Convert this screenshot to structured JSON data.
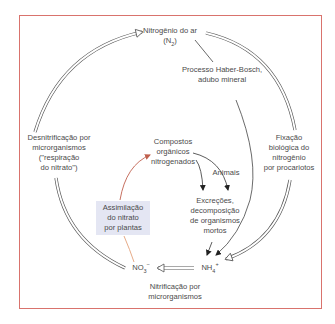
{
  "diagram": {
    "nodes": {
      "n2": {
        "line1": "Nitrogênio do ar",
        "formula_prefix": "(N",
        "formula_sub": "2",
        "formula_suffix": ")"
      },
      "haber": {
        "line1": "Processo Haber-Bosch,",
        "line2": "adubo mineral"
      },
      "denitrification": {
        "line1": "Desnitrificação por",
        "line2": "microrganismos",
        "line3": "(\"respiração",
        "line4": "do nitrato\")"
      },
      "fixation": {
        "line1": "Fixação",
        "line2": "biológica do",
        "line3": "nitrogênio",
        "line4": "por procariotos"
      },
      "organic": {
        "line1": "Compostos",
        "line2": "orgânicos",
        "line3": "nitrogenados"
      },
      "animals": {
        "label": "Animais"
      },
      "excretions": {
        "line1": "Excreções,",
        "line2": "decomposição",
        "line3": "de organismos",
        "line4": "mortos"
      },
      "assimilation": {
        "line1": "Assimilação",
        "line2": "do nitrato",
        "line3": "por plantas"
      },
      "no3": {
        "base": "NO",
        "sub": "3",
        "sup": "−"
      },
      "nh4": {
        "base": "NH",
        "sub": "4",
        "sup": "+"
      },
      "nitrification": {
        "line1": "Nitrificação por",
        "line2": "microrganismos"
      }
    },
    "colors": {
      "frame": "#d9736d",
      "assimilation_arrow": "#c0604e",
      "assimilation_box": "#e4e6f3"
    }
  }
}
